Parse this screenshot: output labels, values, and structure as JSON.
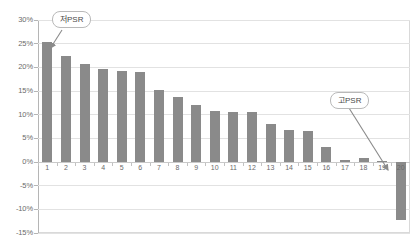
{
  "chart_data": {
    "type": "bar",
    "title": "",
    "subtitle": "",
    "xlabel": "",
    "ylabel": "",
    "categories": [
      "1",
      "2",
      "3",
      "4",
      "5",
      "6",
      "7",
      "8",
      "9",
      "10",
      "11",
      "12",
      "13",
      "14",
      "15",
      "16",
      "17",
      "18",
      "19",
      "20"
    ],
    "values": [
      25.3,
      22.4,
      20.8,
      19.6,
      19.3,
      19.0,
      15.3,
      13.7,
      12.1,
      10.7,
      10.6,
      10.5,
      8.0,
      6.7,
      6.5,
      3.2,
      0.4,
      0.9,
      0.2,
      -12.3
    ],
    "series": [
      {
        "name": "",
        "values": [
          25.3,
          22.4,
          20.8,
          19.6,
          19.3,
          19.0,
          15.3,
          13.7,
          12.1,
          10.7,
          10.6,
          10.5,
          8.0,
          6.7,
          6.5,
          3.2,
          0.4,
          0.9,
          0.2,
          -12.3
        ]
      }
    ],
    "ylim": [
      -15,
      30
    ],
    "ytick_labels": [
      "30%",
      "25%",
      "20%",
      "15%",
      "10%",
      "5%",
      "0%",
      "-5%",
      "-10%",
      "-15%"
    ],
    "ytick_values": [
      30,
      25,
      20,
      15,
      10,
      5,
      0,
      -5,
      -10,
      -15
    ],
    "grid": true,
    "legend": false,
    "legend_position": "none",
    "bar_color": "#8a8a8a",
    "gridline_color": "#e2e2e2",
    "zero_line_color": "#c9c9c9",
    "frame_color": "#d9d9d9",
    "annotations": [
      {
        "id": "low-psr",
        "label": "저PSR",
        "points_to_category": "1",
        "points_to_value": 25.3
      },
      {
        "id": "high-psr",
        "label": "고PSR",
        "points_to_category": "20",
        "points_to_value": -12.3
      }
    ]
  }
}
